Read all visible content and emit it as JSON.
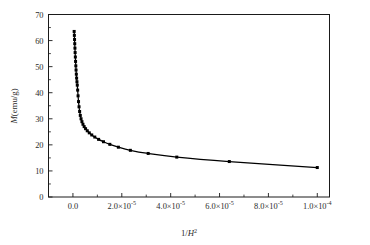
{
  "figure": {
    "background_color": "#ffffff",
    "ink_color": "#000000",
    "marker_shape": "filled-square",
    "line_style": "solid"
  },
  "chart_data": {
    "type": "line",
    "title": "",
    "subtitle": "",
    "xlabel": "1/H²",
    "ylabel": "M(emu/g)",
    "xlabel_parts": {
      "numerator": "1/",
      "symbol": "H",
      "exponent": "2"
    },
    "ylabel_parts": {
      "symbol": "M",
      "unit": "(emu/g)"
    },
    "grid": false,
    "legend": null,
    "legend_position": "none",
    "xlim": [
      -1e-05,
      0.000105
    ],
    "ylim": [
      0,
      70
    ],
    "xticks": [
      0.0,
      2e-05,
      4e-05,
      6e-05,
      8e-05,
      0.0001
    ],
    "xtick_labels": [
      "0.0",
      "2.0×10⁻⁵",
      "4.0×10⁻⁵",
      "6.0×10⁻⁵",
      "8.0×10⁻⁵",
      "1.0×10⁻⁴"
    ],
    "xtick_label_parts": [
      {
        "mantissa": "0.0",
        "times": "",
        "base": "",
        "exp": ""
      },
      {
        "mantissa": "2.0",
        "times": "×",
        "base": "10",
        "exp": "-5"
      },
      {
        "mantissa": "4.0",
        "times": "×",
        "base": "10",
        "exp": "-5"
      },
      {
        "mantissa": "6.0",
        "times": "×",
        "base": "10",
        "exp": "-5"
      },
      {
        "mantissa": "8.0",
        "times": "×",
        "base": "10",
        "exp": "-5"
      },
      {
        "mantissa": "1.0",
        "times": "×",
        "base": "10",
        "exp": "-4"
      }
    ],
    "yticks": [
      0,
      10,
      20,
      30,
      40,
      50,
      60,
      70
    ],
    "ytick_labels": [
      "0",
      "10",
      "20",
      "30",
      "40",
      "50",
      "60",
      "70"
    ],
    "series": [
      {
        "name": "M vs 1/H²",
        "marker": "filled-square",
        "x": [
          5e-07,
          5.8e-07,
          6.6e-07,
          7.4e-07,
          8.2e-07,
          9e-07,
          9.9e-07,
          1.08e-06,
          1.18e-06,
          1.28e-06,
          1.39e-06,
          1.51e-06,
          1.64e-06,
          1.78e-06,
          1.93e-06,
          2.1e-06,
          2.29e-06,
          2.5e-06,
          2.74e-06,
          3.01e-06,
          3.32e-06,
          3.68e-06,
          4.1e-06,
          4.59e-06,
          5.17e-06,
          5.86e-06,
          6.69e-06,
          7.7e-06,
          8.94e-06,
          1.05e-05,
          1.25e-05,
          1.51e-05,
          1.86e-05,
          2.35e-05,
          3.08e-05,
          4.25e-05,
          6.4e-05,
          0.0001
        ],
        "y": [
          63.5,
          62.0,
          60.4,
          58.8,
          57.1,
          55.4,
          53.7,
          52.0,
          50.3,
          48.7,
          47.1,
          45.6,
          44.2,
          42.9,
          41.0,
          38.8,
          36.6,
          34.6,
          32.8,
          31.3,
          30.0,
          28.9,
          27.9,
          27.0,
          26.2,
          25.4,
          24.6,
          23.8,
          23.0,
          22.1,
          21.2,
          20.2,
          19.1,
          17.9,
          16.7,
          15.3,
          13.6,
          11.3
        ]
      }
    ],
    "annotations": []
  }
}
